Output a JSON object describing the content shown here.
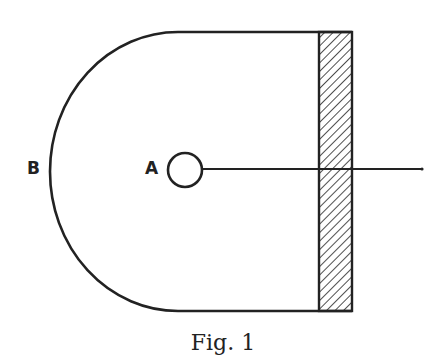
{
  "figure": {
    "caption": "Fig. 1",
    "labels": {
      "A": "A",
      "B": "B"
    },
    "elements": {
      "container": "D-shaped enclosure: semicircular left end (B) with straight top and bottom edges",
      "wall": "hatched rectangular wall on the right side",
      "source": "small circle A at center",
      "line": "horizontal line from circle A extending right through the hatched wall"
    },
    "colors": {
      "stroke": "#222222",
      "background": "#ffffff"
    }
  }
}
